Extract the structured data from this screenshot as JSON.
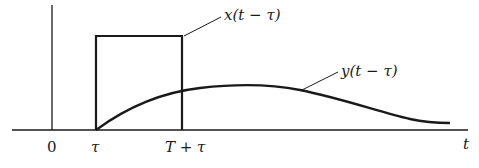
{
  "figure": {
    "type": "signal-timing-diagram",
    "axis": {
      "horizontal_label": "t",
      "ticks": [
        {
          "label": "0",
          "position": "origin"
        },
        {
          "label": "τ",
          "position": "pulse start"
        },
        {
          "label": "T + τ",
          "position": "pulse end"
        }
      ]
    },
    "signals": [
      {
        "name": "x(t − τ)",
        "shape": "rectangular pulse",
        "start": "τ",
        "end": "T + τ"
      },
      {
        "name": "y(t − τ)",
        "shape": "smooth response rising from τ, peaking after T + τ, decaying toward zero"
      }
    ],
    "colors": {
      "ink": "#1a1a1a",
      "background": "#ffffff"
    }
  }
}
